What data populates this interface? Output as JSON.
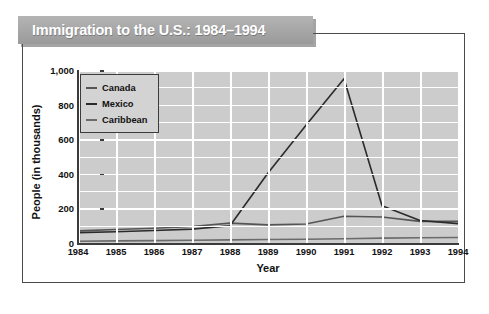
{
  "title": "Immigration to the U.S.: 1984–1994",
  "chart_data": {
    "type": "line",
    "title": "Immigration to the U.S.: 1984–1994",
    "xlabel": "Year",
    "ylabel": "People (in thousands)",
    "categories": [
      "1984",
      "1985",
      "1986",
      "1987",
      "1988",
      "1989",
      "1990",
      "1991",
      "1992",
      "1993",
      "1994"
    ],
    "x": [
      1984,
      1985,
      1986,
      1987,
      1988,
      1989,
      1990,
      1991,
      1992,
      1993,
      1994
    ],
    "xlim": [
      1984,
      1994
    ],
    "ylim": [
      0,
      1000
    ],
    "yticks": [
      "0",
      "200",
      "400",
      "600",
      "800",
      "1,000"
    ],
    "ytick_values": [
      0,
      200,
      400,
      600,
      800,
      1000
    ],
    "grid": true,
    "minor_gridlines": true,
    "legend_position": "top-left",
    "series": [
      {
        "name": "Canada",
        "color": "#555555",
        "values": [
          70,
          78,
          85,
          95,
          115,
          105,
          110,
          155,
          150,
          125,
          125
        ]
      },
      {
        "name": "Mexico",
        "color": "#2b2b2b",
        "values": [
          60,
          65,
          72,
          80,
          100,
          405,
          680,
          950,
          215,
          130,
          112
        ]
      },
      {
        "name": "Caribbean",
        "color": "#6b6b6b",
        "values": [
          10,
          12,
          14,
          16,
          18,
          20,
          22,
          25,
          28,
          30,
          32
        ]
      }
    ]
  },
  "legend": {
    "items": [
      {
        "label": "Canada",
        "color": "#555555"
      },
      {
        "label": "Mexico",
        "color": "#2b2b2b"
      },
      {
        "label": "Caribbean",
        "color": "#6b6b6b"
      }
    ]
  }
}
